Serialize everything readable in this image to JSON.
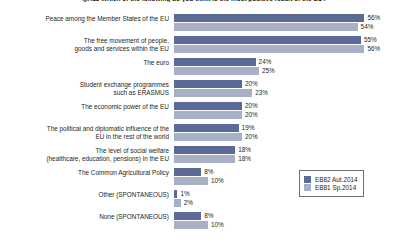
{
  "chart_data": {
    "type": "bar",
    "orientation": "horizontal",
    "title": "QA11 Which of the following do you think is the most positive result of the EU?",
    "xlabel": "",
    "ylabel": "",
    "xlim": [
      0,
      60
    ],
    "grid": false,
    "legend_position": "bottom-right",
    "value_suffix": "%",
    "categories": [
      "Peace among the Member States of the EU",
      "The free movement of people, goods and services within the EU",
      "The euro",
      "Student exchange programmes such as ERASMUS",
      "The economic power of the EU",
      "The political and diplomatic influence of the EU in the rest of the world",
      "The level of social welfare (healthcare, education, pensions) in the EU",
      "The Common Agricultural Policy",
      "Other  (SPONTANEOUS)",
      "None (SPONTANEOUS)"
    ],
    "series": [
      {
        "name": "EB82 Aut.2014",
        "color": "#5b6a96",
        "values": [
          56,
          55,
          24,
          20,
          20,
          19,
          18,
          8,
          1,
          8
        ]
      },
      {
        "name": "EB81 Sp.2014",
        "color": "#a8b0c8",
        "values": [
          54,
          56,
          25,
          23,
          20,
          20,
          18,
          10,
          2,
          10
        ]
      }
    ]
  },
  "rows": [
    {
      "label_lines": [
        "Peace among the Member States of the EU"
      ],
      "v1": "56%",
      "v2": "54%"
    },
    {
      "label_lines": [
        "The free movement of people,",
        "goods and services within the EU"
      ],
      "v1": "55%",
      "v2": "56%"
    },
    {
      "label_lines": [
        "The euro"
      ],
      "v1": "24%",
      "v2": "25%"
    },
    {
      "label_lines": [
        "Student exchange programmes",
        "such as ERASMUS"
      ],
      "v1": "20%",
      "v2": "23%"
    },
    {
      "label_lines": [
        "The economic power of the EU"
      ],
      "v1": "20%",
      "v2": "20%"
    },
    {
      "label_lines": [
        "The political and diplomatic influence of the",
        "EU in the rest of the world"
      ],
      "v1": "19%",
      "v2": "20%"
    },
    {
      "label_lines": [
        "The level of social welfare",
        "(healthcare, education, pensions) in the EU"
      ],
      "v1": "18%",
      "v2": "18%"
    },
    {
      "label_lines": [
        "The Common Agricultural Policy"
      ],
      "v1": "8%",
      "v2": "10%"
    },
    {
      "label_lines": [
        "Other  (SPONTANEOUS)"
      ],
      "v1": "1%",
      "v2": "2%"
    },
    {
      "label_lines": [
        "None (SPONTANEOUS)"
      ],
      "v1": "8%",
      "v2": "10%"
    }
  ],
  "legend": {
    "items": [
      {
        "label": "EB82 Aut.2014",
        "color": "#5b6a96"
      },
      {
        "label": "EB81 Sp.2014",
        "color": "#a8b0c8"
      }
    ]
  }
}
